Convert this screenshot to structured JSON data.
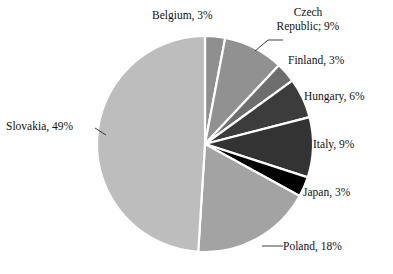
{
  "chart_data": {
    "type": "pie",
    "title": "",
    "subtitle": "",
    "xlabel": "",
    "ylabel": "",
    "grid": false,
    "legend_position": "none",
    "label_format": "name, percent",
    "start_angle_deg": 0,
    "direction": "clockwise",
    "categories": [
      "Belgium",
      "Czech Republic",
      "Finland",
      "Hungary",
      "Italy",
      "Japan",
      "Poland",
      "Slovakia"
    ],
    "values": [
      3,
      9,
      3,
      6,
      9,
      3,
      18,
      49
    ],
    "units": "%",
    "slices": [
      {
        "name": "Belgium",
        "value": 3,
        "label": "Belgium, 3%",
        "color": "#8f8f8f",
        "leader_line": false
      },
      {
        "name": "Czech Republic",
        "value": 9,
        "label": "Czech Republic; 9%",
        "label_line1": "Czech",
        "label_line2": "Republic; 9%",
        "color": "#919191",
        "leader_line": true
      },
      {
        "name": "Finland",
        "value": 3,
        "label": "Finland, 3%",
        "color": "#6e6e6e",
        "leader_line": false
      },
      {
        "name": "Hungary",
        "value": 6,
        "label": "Hungary, 6%",
        "color": "#3c3c3c",
        "leader_line": false
      },
      {
        "name": "Italy",
        "value": 9,
        "label": "Italy, 9%",
        "color": "#333333",
        "leader_line": false
      },
      {
        "name": "Japan",
        "value": 3,
        "label": "Japan, 3%",
        "color": "#000000",
        "leader_line": false
      },
      {
        "name": "Poland",
        "value": 18,
        "label": "Poland, 18%",
        "color": "#a3a3a3",
        "leader_line": true
      },
      {
        "name": "Slovakia",
        "value": 49,
        "label": "Slovakia, 49%",
        "color": "#bdbdbd",
        "leader_line": true
      }
    ],
    "geometry": {
      "center_x": 205,
      "center_y": 144,
      "radius": 108,
      "separator_color": "#ffffff",
      "separator_width": 2.2
    },
    "background_color": "#ffffff",
    "text_color": "#111111"
  },
  "labels": {
    "belgium": "Belgium, 3%",
    "czech_line1": "Czech",
    "czech_line2": "Republic; 9%",
    "finland": "Finland, 3%",
    "hungary": "Hungary, 6%",
    "italy": "Italy, 9%",
    "japan": "Japan, 3%",
    "poland": "Poland, 18%",
    "slovakia": "Slovakia, 49%"
  }
}
